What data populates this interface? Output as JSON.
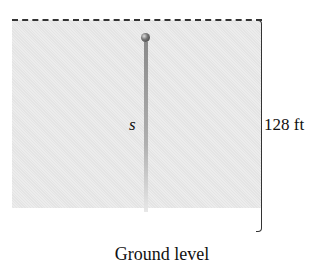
{
  "diagram": {
    "height_label": "128 ft",
    "variable_label": "s",
    "ground_label": "Ground level"
  },
  "colors": {
    "panel": "#e8e8e8",
    "ground": "#9a9a9a",
    "line": "#333333"
  }
}
